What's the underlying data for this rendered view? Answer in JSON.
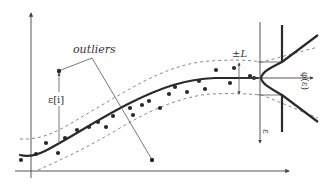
{
  "diagram": {
    "title": "",
    "labels": {
      "outliers": "outliers",
      "residual": "ε[i]",
      "band": "±L",
      "loss_fn": "φ(ε)",
      "epsilon_axis": "ε"
    },
    "colors": {
      "curve": "#2a2a2a",
      "points": "#2a2a2a",
      "band": "#888888",
      "axis": "#444444"
    },
    "points": [
      [
        21,
        160
      ],
      [
        36,
        154
      ],
      [
        46,
        143
      ],
      [
        58,
        153
      ],
      [
        65,
        138
      ],
      [
        77,
        130
      ],
      [
        89,
        127
      ],
      [
        98,
        122
      ],
      [
        106,
        127
      ],
      [
        113,
        116
      ],
      [
        130,
        108
      ],
      [
        133,
        115
      ],
      [
        142,
        105
      ],
      [
        149,
        101
      ],
      [
        160,
        108
      ],
      [
        169,
        94
      ],
      [
        175,
        87
      ],
      [
        187,
        92
      ],
      [
        199,
        81
      ],
      [
        205,
        89
      ],
      [
        216,
        70
      ],
      [
        230,
        83
      ],
      [
        234,
        68
      ],
      [
        250,
        76
      ],
      [
        254,
        78
      ]
    ],
    "outliers": [
      [
        59,
        71
      ],
      [
        152,
        160
      ]
    ]
  }
}
